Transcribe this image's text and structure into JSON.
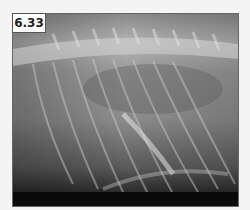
{
  "figure": {
    "label": "6.33",
    "image_description": "Lateral thoracic radiograph showing spine along top, ribs and lung fields"
  }
}
